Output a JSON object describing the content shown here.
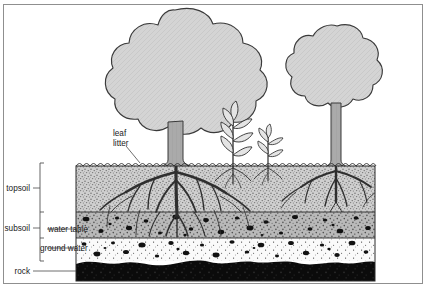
{
  "diagram": {
    "labels": {
      "leaf_litter_line1": "leaf",
      "leaf_litter_line2": "litter",
      "topsoil": "topsoil",
      "subsoil": "subsoil",
      "water_table": "water table",
      "ground_water": "ground water",
      "rock": "rock"
    },
    "layers": [
      {
        "name": "topsoil",
        "fill": "#c9c9c9",
        "top": 166,
        "bottom": 212
      },
      {
        "name": "subsoil",
        "fill": "#b4b4b4",
        "top": 212,
        "bottom": 238
      },
      {
        "name": "ground_water",
        "fill": "#f7f7f7",
        "top": 238,
        "bottom": 261
      },
      {
        "name": "rock",
        "fill": "#0d0d0d",
        "top": 261,
        "bottom": 281
      }
    ],
    "colors": {
      "canopy": "#d0d0d0",
      "outline": "#3a3a3a",
      "trunk": "#a8a8a8",
      "rock": "#0d0d0d",
      "frame": "#8f8f8f",
      "text": "#1a1a1a"
    },
    "plants": [
      {
        "name": "large-tree-left",
        "kind": "tree",
        "canopy_cx": 175,
        "canopy_cy": 70
      },
      {
        "name": "seedling-tall",
        "kind": "seedling",
        "x": 233
      },
      {
        "name": "seedling-short",
        "kind": "seedling",
        "x": 268
      },
      {
        "name": "large-tree-right",
        "kind": "tree",
        "canopy_cx": 337,
        "canopy_cy": 72
      }
    ],
    "soil_block": {
      "left": 76,
      "right": 375,
      "surface_y": 166,
      "base_y": 281
    }
  }
}
